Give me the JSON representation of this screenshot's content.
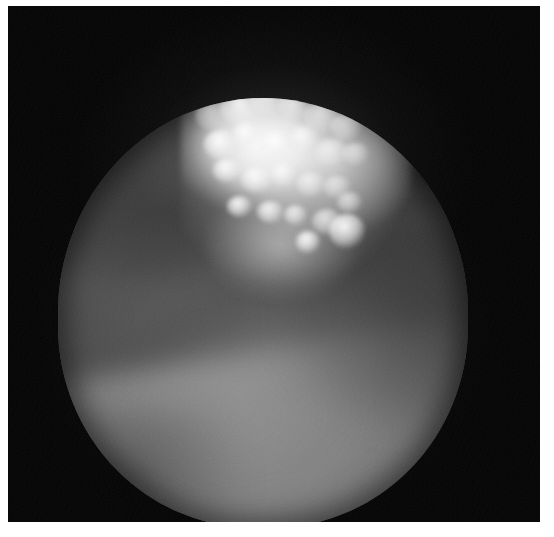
{
  "image": {
    "kind": "endoscopic-photograph",
    "modality_label": "Cystoscopy",
    "color_mode": "grayscale",
    "width_px": 554,
    "height_px": 537,
    "border_color": "#ffffff",
    "background_color": "#050505",
    "alt_text": "Grayscale endoscopic photograph showing a circular field of view with a bright cauliflower-like papillary lesion in the upper area and smooth mucosal tissue below."
  },
  "frame": {
    "name": "dark-photographic-frame",
    "left_px": 8,
    "top_px": 6,
    "width_px": 532,
    "height_px": 516,
    "fill": "#050505"
  },
  "field_of_view": {
    "name": "circular-endoscope-field",
    "shape": "circle",
    "center_x_px": 255,
    "center_y_px": 307,
    "radius_px": 205,
    "base_tone": "#828282",
    "rim_tone": "#3e3e3e",
    "notch": {
      "name": "upper-right-notch",
      "present": true,
      "approx_x_px": 425,
      "approx_y_px": 170
    }
  },
  "features": [
    {
      "name": "papillary-lesion",
      "description": "Bright cauliflower-like papillary tumour mass",
      "brightness": "very-high",
      "highlight_color": "#ffffff",
      "region": "upper-centre",
      "bbox_px": [
        180,
        100,
        240,
        190
      ]
    },
    {
      "name": "mucosal-surface",
      "description": "Smooth mid-grey mucosal wall filling the lower field",
      "brightness": "medium",
      "tone_color": "#8a8a8a",
      "region": "lower",
      "bbox_px": [
        70,
        260,
        380,
        250
      ]
    },
    {
      "name": "diagonal-shadow-band",
      "description": "Darker diagonal shadow crossing from upper-left to lower-right",
      "brightness": "low",
      "tone_color": "#4a4a4a",
      "region": "mid",
      "bbox_px": [
        90,
        215,
        370,
        130
      ]
    },
    {
      "name": "secondary-highlight",
      "description": "Small bright papillary nodule on the right flank",
      "brightness": "high",
      "highlight_color": "#f0f0f0",
      "region": "right-mid",
      "bbox_px": [
        330,
        220,
        50,
        45
      ]
    },
    {
      "name": "upper-left-shadow",
      "description": "Dark shadowed recess at the upper-left of the field",
      "brightness": "low",
      "tone_color": "#3c3c3c",
      "region": "upper-left",
      "bbox_px": [
        75,
        175,
        160,
        120
      ]
    }
  ],
  "fronds": [
    {
      "x": 6,
      "y": 10,
      "w": 16,
      "h": 14
    },
    {
      "x": 17,
      "y": 5,
      "w": 20,
      "h": 17
    },
    {
      "x": 30,
      "y": 2,
      "w": 17,
      "h": 15
    },
    {
      "x": 42,
      "y": 6,
      "w": 15,
      "h": 13
    },
    {
      "x": 53,
      "y": 10,
      "w": 18,
      "h": 15
    },
    {
      "x": 65,
      "y": 16,
      "w": 14,
      "h": 13
    },
    {
      "x": 10,
      "y": 24,
      "w": 15,
      "h": 14
    },
    {
      "x": 22,
      "y": 20,
      "w": 13,
      "h": 12
    },
    {
      "x": 34,
      "y": 24,
      "w": 16,
      "h": 14
    },
    {
      "x": 47,
      "y": 22,
      "w": 13,
      "h": 12
    },
    {
      "x": 58,
      "y": 28,
      "w": 15,
      "h": 13
    },
    {
      "x": 70,
      "y": 30,
      "w": 12,
      "h": 11
    },
    {
      "x": 14,
      "y": 38,
      "w": 12,
      "h": 11
    },
    {
      "x": 26,
      "y": 42,
      "w": 14,
      "h": 12
    },
    {
      "x": 39,
      "y": 40,
      "w": 11,
      "h": 11
    },
    {
      "x": 50,
      "y": 44,
      "w": 13,
      "h": 12
    },
    {
      "x": 62,
      "y": 46,
      "w": 12,
      "h": 11
    },
    {
      "x": 20,
      "y": 56,
      "w": 11,
      "h": 10
    },
    {
      "x": 33,
      "y": 58,
      "w": 12,
      "h": 11
    },
    {
      "x": 45,
      "y": 60,
      "w": 10,
      "h": 10
    },
    {
      "x": 57,
      "y": 62,
      "w": 13,
      "h": 12
    },
    {
      "x": 68,
      "y": 54,
      "w": 11,
      "h": 10
    }
  ]
}
